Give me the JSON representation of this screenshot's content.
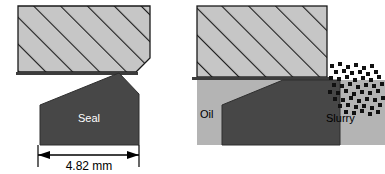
{
  "figure": {
    "panels": [
      {
        "id": "left-panel",
        "name": "dimensioned-seal-panel",
        "labels": {
          "seal": "Seal"
        },
        "dimension": {
          "value": "4.82 mm",
          "number": 4.82,
          "unit": "mm",
          "measures": "seal base width"
        }
      },
      {
        "id": "right-panel",
        "name": "oil-slurry-seal-panel",
        "labels": {
          "oil": "Oil",
          "slurry": "Slurry"
        }
      }
    ]
  },
  "colors": {
    "hatch_fill": "#c6c6c6",
    "hatch_line": "#1a1a1a",
    "seal_fill": "#474747",
    "oil_fill": "#b4b4b4",
    "slurry_particle": "#111111",
    "outline": "#1a1a1a",
    "background": "#ffffff",
    "seal_label": "#ffffff",
    "text": "#000000"
  },
  "icons": {
    "hatched_block": "hatched-block-icon",
    "seal_body": "seal-body-icon",
    "slurry_cluster": "slurry-particle-cluster-icon",
    "dimension_arrow": "dimension-arrow-icon"
  }
}
